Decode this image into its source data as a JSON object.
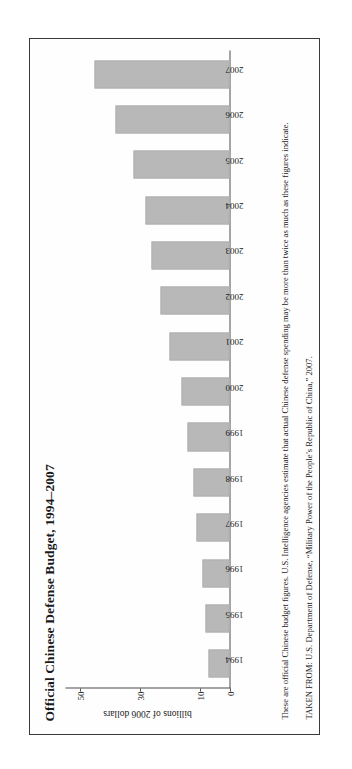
{
  "figure": {
    "title": "Official Chinese Defense Budget, 1994–2007",
    "caption": "These are official Chinese budget figures. U.S. Intelligence agencies estimate that actual Chinese defense spending may be more than twice as much as these figures indicate.",
    "source": "TAKEN FROM: U.S. Department of Defense, “Military Power of the People’s Republic of China,” 2007.",
    "bar_color": "#b8b8b8",
    "axis_color": "#4a4a4a",
    "frame_color": "#3a3a3a"
  },
  "chart_data": {
    "type": "bar",
    "title": "Official Chinese Defense Budget, 1994–2007",
    "xlabel": "",
    "ylabel": "billions of 2006 dollars",
    "categories": [
      "1994",
      "1995",
      "1996",
      "1997",
      "1998",
      "1999",
      "2000",
      "2001",
      "2002",
      "2003",
      "2004",
      "2005",
      "2006",
      "2007"
    ],
    "values": [
      7,
      8,
      9,
      11,
      12,
      14,
      16,
      20,
      23,
      26,
      28,
      32,
      38,
      45
    ],
    "ylim": [
      0,
      55
    ],
    "yticks": [
      0,
      10,
      30,
      50
    ],
    "ytick_labels": [
      "0",
      "10",
      "30",
      "50"
    ],
    "grid": false,
    "legend": null,
    "orientation": "vertical",
    "series": [
      {
        "name": "Official Chinese Defense Budget",
        "values": [
          7,
          8,
          9,
          11,
          12,
          14,
          16,
          20,
          23,
          26,
          28,
          32,
          38,
          45
        ]
      }
    ]
  }
}
